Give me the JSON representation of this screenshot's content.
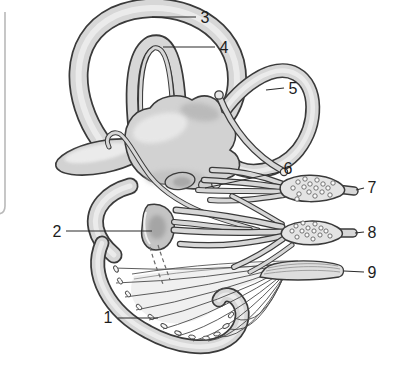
{
  "figure": {
    "description_labels": [
      "1",
      "2",
      "3",
      "4",
      "5",
      "6",
      "7",
      "8",
      "9"
    ],
    "labels": [
      {
        "number": "1",
        "target": "cochlear-duct"
      },
      {
        "number": "2",
        "target": "saccule"
      },
      {
        "number": "3",
        "target": "anterior-semicircular-canal"
      },
      {
        "number": "4",
        "target": "anterior-membranous-duct"
      },
      {
        "number": "5",
        "target": "posterior-semicircular-canal"
      },
      {
        "number": "6",
        "target": "ampullary-nerve-twig"
      },
      {
        "number": "7",
        "target": "vestibular-ganglion-superior"
      },
      {
        "number": "8",
        "target": "vestibular-ganglion-inferior"
      },
      {
        "number": "9",
        "target": "cochlear-nerve"
      }
    ],
    "colors": {
      "background": "#ffffff",
      "outline": "#3a3a3a",
      "tube_fill": "#d7d7d7",
      "tube_highlight": "#eeeeee",
      "leader": "#2b2b2b",
      "label_text": "#1d1d1d",
      "page_border": "#b9b9b9"
    }
  }
}
